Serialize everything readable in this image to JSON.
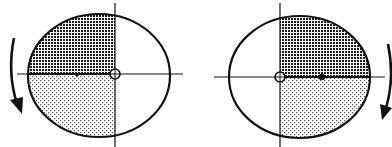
{
  "diagram": {
    "colors": {
      "stroke": "#111111",
      "background": "#ffffff",
      "dense_pattern": "#1a1a1a",
      "light_pattern": "#555555"
    },
    "figures": [
      {
        "id": "left",
        "shaded_side": "left",
        "upper_pattern": "dense-grid",
        "lower_pattern": "sparse-dots",
        "rotation_arrow": "left-side, pointing downward (counterclockwise)",
        "pivot_marker": "hollow-circle-with-cross",
        "centroid_marker": "filled-dot"
      },
      {
        "id": "right",
        "shaded_side": "right",
        "upper_pattern": "dense-grid",
        "lower_pattern": "sparse-dots",
        "rotation_arrow": "right-side, pointing downward (clockwise)",
        "pivot_marker": "hollow-circle-with-cross",
        "centroid_marker": "filled-dot"
      }
    ]
  }
}
